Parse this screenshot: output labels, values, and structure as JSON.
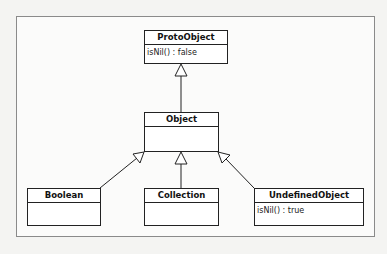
{
  "diagram": {
    "type": "uml-class-inheritance",
    "classes": [
      {
        "id": "protoobject",
        "name": "ProtoObject",
        "attributes": [
          "isNil() : false"
        ]
      },
      {
        "id": "object",
        "name": "Object",
        "attributes": []
      },
      {
        "id": "boolean",
        "name": "Boolean",
        "attributes": []
      },
      {
        "id": "collection",
        "name": "Collection",
        "attributes": []
      },
      {
        "id": "undefinedobject",
        "name": "UndefinedObject",
        "attributes": [
          "isNil() : true"
        ]
      }
    ],
    "relations": [
      {
        "from": "Object",
        "to": "ProtoObject",
        "kind": "generalization"
      },
      {
        "from": "Boolean",
        "to": "Object",
        "kind": "generalization"
      },
      {
        "from": "Collection",
        "to": "Object",
        "kind": "generalization"
      },
      {
        "from": "UndefinedObject",
        "to": "Object",
        "kind": "generalization"
      }
    ],
    "colors": {
      "line": "#222222",
      "frame": "#8a8a8a",
      "background": "#f4f4f2"
    }
  }
}
